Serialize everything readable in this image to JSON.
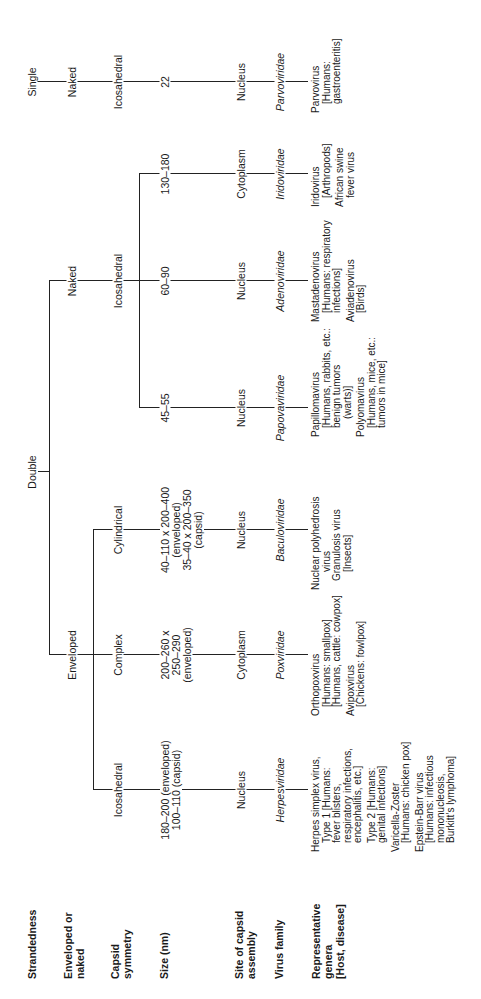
{
  "row_labels": {
    "strandedness": "Strandedness",
    "enveloped": [
      "Enveloped or",
      "naked"
    ],
    "capsid": [
      "Capsid",
      "symmetry"
    ],
    "size": "Size (nm)",
    "site": [
      "Site of capsid",
      "assembly"
    ],
    "family": "Virus family",
    "genera": [
      "Representative",
      "genera",
      "[Host, disease]"
    ]
  },
  "strandedness": {
    "double": "Double",
    "single": "Single"
  },
  "envelope": {
    "enveloped": "Enveloped",
    "naked": "Naked",
    "naked_single": "Naked"
  },
  "columns": [
    {
      "capsid": "Icosahedral",
      "size": [
        "180–200 (enveloped)",
        "100–110 (capsid)"
      ],
      "site": "Nucleus",
      "family": "Herpesviridae",
      "genera": [
        {
          "t": "Herpes simplex virus,",
          "c": "blk"
        },
        {
          "t": "Type 1 [Humans:",
          "c": "ind"
        },
        {
          "t": "fever blisters,",
          "c": "ind"
        },
        {
          "t": "respiratory infections,",
          "c": "ind"
        },
        {
          "t": "encephalitis, etc.]",
          "c": "ind"
        },
        {
          "t": "",
          "c": "sp"
        },
        {
          "t": "Type 2 [Humans:",
          "c": "ind"
        },
        {
          "t": "genital infections]",
          "c": "ind"
        },
        {
          "t": "",
          "c": "sp"
        },
        {
          "t": "Varicella-Zoster",
          "c": "blk"
        },
        {
          "t": "[Humans: chicken pox]",
          "c": "ind"
        },
        {
          "t": "",
          "c": "sp"
        },
        {
          "t": "Epstein-Barr virus",
          "c": "blk"
        },
        {
          "t": "[Humans: infectious",
          "c": "ind"
        },
        {
          "t": "mononucleosis,",
          "c": "ind"
        },
        {
          "t": "Burkitt’s lymphoma]",
          "c": "ind"
        }
      ]
    },
    {
      "capsid": "Complex",
      "size": [
        "200–260 x",
        "250–290",
        "(enveloped)"
      ],
      "site": "Cytoplasm",
      "family": "Poxviridae",
      "genera": [
        {
          "t": "Orthopoxvirus",
          "c": "blk"
        },
        {
          "t": "[Humans: smallpox]",
          "c": "ind"
        },
        {
          "t": "[Humans, cattle: cowpox]",
          "c": "ind"
        },
        {
          "t": "",
          "c": "sp"
        },
        {
          "t": "Avipoxvirus",
          "c": "blk"
        },
        {
          "t": "[Chickens: fowlpox]",
          "c": "ind"
        }
      ]
    },
    {
      "capsid": "Cylindrical",
      "size": [
        "40–110 x 200–400",
        "(enveloped)",
        "35–40 x 200–350",
        "(capsid)"
      ],
      "site": "Nucleus",
      "family": "Baculoviridae",
      "genera": [
        {
          "t": "Nuclear polyhedrosis",
          "c": "blk"
        },
        {
          "t": "virus",
          "c": "ind2"
        },
        {
          "t": "Granulosis virus",
          "c": "ind"
        },
        {
          "t": "[Insects]",
          "c": "ind2"
        }
      ]
    },
    {
      "size": [
        "45–55"
      ],
      "site": "Nucleus",
      "family": "Papovaviridae",
      "genera": [
        {
          "t": "Papillomavirus",
          "c": "blk"
        },
        {
          "t": "[Humans, rabbits, etc.:",
          "c": "ind"
        },
        {
          "t": "benign tumors",
          "c": "ind"
        },
        {
          "t": "(warts)]",
          "c": "ind2"
        },
        {
          "t": "",
          "c": "sp"
        },
        {
          "t": "Polyomavirus",
          "c": "blk"
        },
        {
          "t": "[Humans, mice, etc.:",
          "c": "ind"
        },
        {
          "t": "tumors in mice]",
          "c": "ind"
        }
      ]
    },
    {
      "capsid": "Icosahedral",
      "size": [
        "60–90"
      ],
      "site": "Nucleus",
      "family": "Adenoviridae",
      "genera": [
        {
          "t": "Mastadenovirus",
          "c": "blk"
        },
        {
          "t": "[Humans: respiratory",
          "c": "ind"
        },
        {
          "t": "infections]",
          "c": "ind"
        },
        {
          "t": "",
          "c": "sp"
        },
        {
          "t": "Aviadenovirus",
          "c": "blk"
        },
        {
          "t": "[Birds]",
          "c": "ind"
        }
      ]
    },
    {
      "size": [
        "130–180"
      ],
      "site": "Cytoplasm",
      "family": "Iridoviridae",
      "genera": [
        {
          "t": "Iridovirus",
          "c": "blk"
        },
        {
          "t": "[Arthropods]",
          "c": "ind"
        },
        {
          "t": "",
          "c": "sp"
        },
        {
          "t": "African swine",
          "c": "blk"
        },
        {
          "t": "fever virus",
          "c": "ind"
        }
      ]
    },
    {
      "capsid": "Icosahedral",
      "size": [
        "22"
      ],
      "site": "Nucleus",
      "family": "Parvoviridae",
      "genera": [
        {
          "t": "Parvovirus",
          "c": "blk"
        },
        {
          "t": "[Humans:",
          "c": "ind"
        },
        {
          "t": "gastroenteritis]",
          "c": "ind"
        }
      ]
    }
  ]
}
